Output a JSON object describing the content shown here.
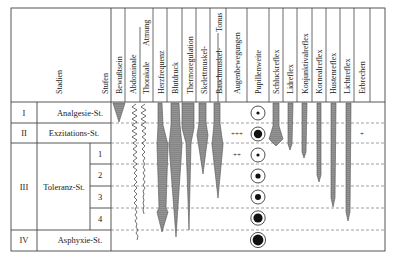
{
  "header": {
    "stadien_label": "Stadien",
    "stufen_label": "Stufen",
    "columns": [
      {
        "key": "bewusstsein",
        "label": "Bewußtsein"
      },
      {
        "key": "abdominale",
        "label": "Abdominale"
      },
      {
        "key": "thorakale",
        "label": "Thorakale"
      },
      {
        "key": "atmung_group",
        "label": "Atmung"
      },
      {
        "key": "herzfrequenz",
        "label": "Herzfrequenz"
      },
      {
        "key": "blutdruck",
        "label": "Blutdruck"
      },
      {
        "key": "thermoregulation",
        "label": "Thermoregulation"
      },
      {
        "key": "skelettmuskel",
        "label": "Skelettmuskel-"
      },
      {
        "key": "bauchmuskel",
        "label": "Bauchmuskel-"
      },
      {
        "key": "tonus_group",
        "label": "Tonus"
      },
      {
        "key": "augenbewegungen",
        "label": "Augenbewegungen"
      },
      {
        "key": "pupillenweite",
        "label": "Pupillenweite"
      },
      {
        "key": "schluckreflex",
        "label": "Schluckreflex"
      },
      {
        "key": "lidreflex",
        "label": "Lidreflex"
      },
      {
        "key": "konjunktivalreflex",
        "label": "Konjunktivalreflex"
      },
      {
        "key": "kornealreflex",
        "label": "Kornealreflex"
      },
      {
        "key": "hustenreflex",
        "label": "Hustenreflex"
      },
      {
        "key": "lichtreflex",
        "label": "Lichtreflex"
      },
      {
        "key": "erbrechen",
        "label": "Erbrechen"
      }
    ]
  },
  "stages": [
    {
      "numeral": "I",
      "name": "Analgesie-St."
    },
    {
      "numeral": "II",
      "name": "Exzitations-St."
    },
    {
      "numeral": "III",
      "name": "Toleranz-St.",
      "levels": [
        "1",
        "2",
        "3",
        "4"
      ]
    },
    {
      "numeral": "IV",
      "name": "Asphyxie-St."
    }
  ],
  "annotations": {
    "augen_stage2": "+++",
    "augen_stage3_1": "++",
    "erbrechen_stage2": "+"
  },
  "pupil_sizes": [
    "small-dot",
    "large",
    "small-dot",
    "medium",
    "medium",
    "large",
    "large",
    "largest"
  ],
  "colors": {
    "bar_fill": "#8f8f8f",
    "bar_stroke": "#555555",
    "grid": "#444444",
    "dashed": "#777777"
  }
}
